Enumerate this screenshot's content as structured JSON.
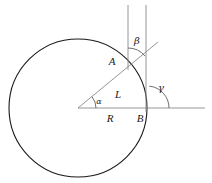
{
  "figure": {
    "type": "geometry-diagram",
    "background_color": "#ffffff",
    "stroke_color_circle": "#1a1a1a",
    "stroke_color_rays": "#8a8a8a",
    "stroke_color_verticals": "#8a8a8a",
    "label_color": "#1a1a1a"
  },
  "geometry": {
    "circle": {
      "center_x": 78,
      "center_y": 108,
      "radius": 69
    },
    "center_point": {
      "x": 78,
      "y": 108
    },
    "point_A": {
      "x": 124,
      "y": 57
    },
    "point_B": {
      "x": 147,
      "y": 108
    },
    "horizontal_ray": {
      "x1": 78,
      "y1": 108,
      "x2": 205,
      "y2": 108
    },
    "diagonal_ray": {
      "x1": 78,
      "y1": 108,
      "x2": 158,
      "y2": 42
    },
    "vertical_line_left": {
      "x": 128,
      "y1": 5,
      "y2": 70
    },
    "vertical_line_right": {
      "x": 146,
      "y1": 5,
      "y2": 112
    }
  },
  "labels": {
    "point_a": {
      "text": "A",
      "x": 112,
      "y": 62
    },
    "point_b": {
      "text": "B",
      "x": 140,
      "y": 119
    },
    "length_l": {
      "text": "L",
      "x": 118,
      "y": 95
    },
    "radius_r": {
      "text": "R",
      "x": 110,
      "y": 119
    },
    "angle_alpha": {
      "text": "α",
      "x": 99,
      "y": 102
    },
    "angle_beta": {
      "text": "β",
      "x": 137,
      "y": 41
    },
    "angle_gamma": {
      "text": "γ",
      "x": 161,
      "y": 88
    }
  },
  "angle_arcs": {
    "alpha": {
      "vertex_x": 78,
      "vertex_y": 108,
      "radius": 18,
      "start_deg": 0,
      "end_deg": -39
    },
    "beta": {
      "vertex_x": 128,
      "vertex_y": 70,
      "radius": 22,
      "start_deg": -90,
      "end_deg": -39
    },
    "gamma": {
      "vertex_x": 147,
      "vertex_y": 108,
      "radius": 22,
      "start_deg": 0,
      "end_deg": -84
    }
  }
}
